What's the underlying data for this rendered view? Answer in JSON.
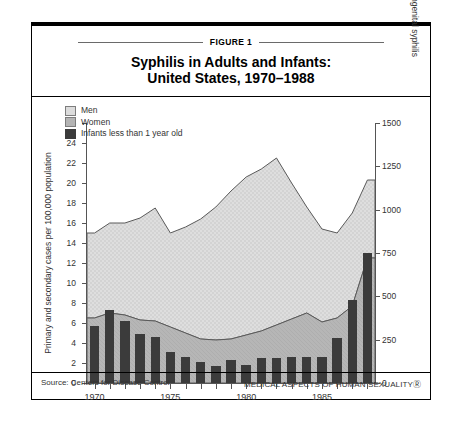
{
  "figure": {
    "label": "FIGURE 1",
    "title_line1": "Syphilis in Adults and Infants:",
    "title_line2": "United States, 1970–1988",
    "source": "Source: Centers for Disease Control",
    "publication": "MEDICAL ASPECTS OF HUMAN SEXUALITYⓇ"
  },
  "legend": {
    "position": "top-left-inside",
    "items": [
      {
        "label": "Men",
        "color": "#dcdcdc"
      },
      {
        "label": "Women",
        "color": "#b4b4b4"
      },
      {
        "label": "Infants less than 1 year old",
        "color": "#3b3b3b"
      }
    ]
  },
  "chart_data": {
    "type": "area",
    "title": "Syphilis in Adults and Infants: United States, 1970–1988",
    "xlabel": "",
    "ylabel": "Primary and secondary cases per 100,000 population",
    "y2label": "No. of cases of congenital syphilis",
    "grid": false,
    "x": [
      1970,
      1971,
      1972,
      1973,
      1974,
      1975,
      1976,
      1977,
      1978,
      1979,
      1980,
      1981,
      1982,
      1983,
      1984,
      1985,
      1986,
      1987,
      1988
    ],
    "xtick_labels": [
      "1970",
      "1975",
      "1980",
      "1985"
    ],
    "xtick_values": [
      1970,
      1975,
      1980,
      1985
    ],
    "ylim": [
      0,
      26
    ],
    "ytick_values": [
      0,
      2,
      4,
      6,
      8,
      10,
      12,
      14,
      16,
      18,
      20,
      22,
      24,
      26
    ],
    "y2lim": [
      0,
      1500
    ],
    "y2tick_values": [
      0,
      250,
      500,
      750,
      1000,
      1250,
      1500
    ],
    "series": [
      {
        "name": "Men",
        "kind": "stacked-area-top",
        "note": "upper boundary = total primary and secondary cases per 100,000",
        "values": [
          15.0,
          16.0,
          16.0,
          16.5,
          17.5,
          15.0,
          15.6,
          16.4,
          17.6,
          19.2,
          20.6,
          21.4,
          22.5,
          20.0,
          17.6,
          15.4,
          15.0,
          17.0,
          20.3
        ]
      },
      {
        "name": "Women",
        "kind": "stacked-area-bottom",
        "note": "lower boundary = female primary and secondary cases per 100,000",
        "values": [
          6.5,
          7.0,
          6.8,
          6.3,
          6.2,
          5.6,
          5.0,
          4.4,
          4.3,
          4.4,
          4.8,
          5.2,
          5.8,
          6.4,
          7.0,
          6.1,
          6.5,
          7.7,
          12.5
        ]
      },
      {
        "name": "Infants less than 1 year old",
        "kind": "bar",
        "axis": "right",
        "note": "bar values read on right axis, No. of cases of congenital syphilis",
        "values_right_axis": [
          330,
          420,
          360,
          282,
          264,
          180,
          150,
          120,
          96,
          132,
          102,
          144,
          144,
          150,
          150,
          150,
          258,
          480,
          750
        ],
        "values_left_axis": [
          5.5,
          7.0,
          6.0,
          4.7,
          4.4,
          3.0,
          2.5,
          2.0,
          1.6,
          2.2,
          1.7,
          2.4,
          2.4,
          2.5,
          2.5,
          2.5,
          4.3,
          8.0,
          12.5
        ]
      }
    ]
  }
}
